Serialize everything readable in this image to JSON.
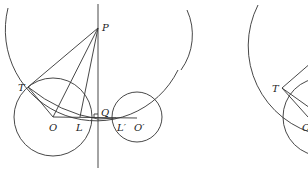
{
  "figure_left": {
    "labels": {
      "P": "P",
      "T": "T",
      "O": "O",
      "L": "L",
      "Q": "Q",
      "L_prime": "L′",
      "O_prime": "O′"
    },
    "points": {
      "P": [
        98,
        28
      ],
      "T": [
        28,
        87
      ],
      "O": [
        53,
        117
      ],
      "L": [
        80,
        117
      ],
      "Q": [
        98,
        118
      ],
      "L_prime": [
        116,
        118
      ],
      "O_prime": [
        137,
        118
      ]
    },
    "circles": {
      "big_circle_center_P_radius": 91,
      "circle_O_radius": 39,
      "circle_O_prime_radius": 25
    },
    "right_angle_at": "Q"
  },
  "figure_right": {
    "labels": {
      "T": "T",
      "O": "O"
    },
    "partial": true
  },
  "colors": {
    "stroke": "#333333",
    "background": "#ffffff"
  }
}
